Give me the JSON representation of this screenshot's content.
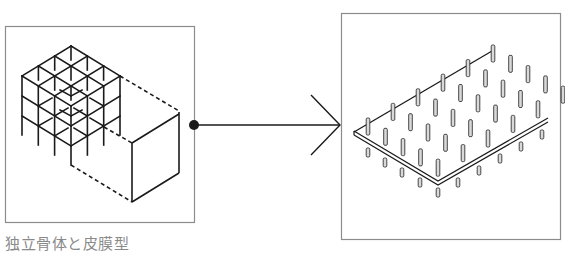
{
  "diagram": {
    "left_panel": {
      "caption": "独立骨体と皮膜型",
      "description": "3x3x3 skeletal frame grid connected by dashed outline to an enclosing membrane box"
    },
    "connector": {
      "type": "dot-line-arrow",
      "direction": "right"
    },
    "right_panel": {
      "description": "isometric flat slab with a grid of vertical posts piercing through it",
      "caption": ""
    },
    "colors": {
      "stroke": "#1a1a1a",
      "frame_border": "#8c8c8c",
      "caption_text": "#8a8a8a",
      "post_fill": "#d9d9d9"
    }
  }
}
